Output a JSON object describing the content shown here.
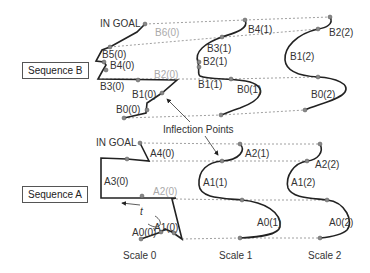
{
  "sequences": {
    "b": {
      "label": "Sequence B",
      "goal_label": "IN GOAL",
      "scale0": [
        "B0(0)",
        "B1(0)",
        "B2(0)",
        "B3(0)",
        "B4(0)",
        "B5(0)",
        "B6(0)"
      ],
      "scale1": [
        "B0(1)",
        "B1(1)",
        "B2(1)",
        "B3(1)",
        "B4(1)"
      ],
      "scale2": [
        "B0(2)",
        "B1(2)",
        "B2(2)"
      ]
    },
    "a": {
      "label": "Sequence A",
      "goal_label": "IN GOAL",
      "scale0": [
        "A0(0)",
        "A1(0)",
        "A2(0)",
        "A3(0)",
        "A4(0)"
      ],
      "scale1": [
        "A0(1)",
        "A1(1)",
        "A2(1)"
      ],
      "scale2": [
        "A0(2)",
        "A1(2)",
        "A2(2)"
      ],
      "time_label": "t"
    }
  },
  "annotations": {
    "inflection_points": "Inflection Points"
  },
  "scales": [
    "Scale 0",
    "Scale 1",
    "Scale 2"
  ],
  "colors": {
    "curve": "#222222",
    "dashed": "#888888",
    "point": "#888888",
    "faded_label": "#aaaaaa"
  }
}
